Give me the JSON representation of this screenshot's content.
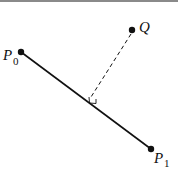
{
  "diagram": {
    "points": [
      {
        "id": "P0",
        "label": "P",
        "subscript": "0",
        "x": 21,
        "y": 52
      },
      {
        "id": "P1",
        "label": "P",
        "subscript": "1",
        "x": 151,
        "y": 149
      },
      {
        "id": "Q",
        "label": "Q",
        "subscript": "",
        "x": 132,
        "y": 30
      }
    ],
    "segment": {
      "from": "P0",
      "to": "P1",
      "style": "solid"
    },
    "perpendicular": {
      "from": "Q",
      "foot_x": 93,
      "foot_y": 101,
      "style": "dashed",
      "right_angle_marker": true
    },
    "colors": {
      "ink": "#111111",
      "rule": "#8a8a8a",
      "background": "#ffffff"
    }
  }
}
